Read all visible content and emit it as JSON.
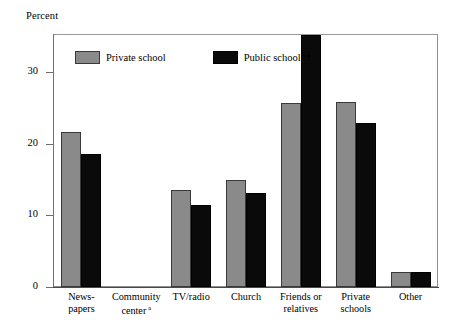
{
  "chart_data": {
    "type": "bar",
    "title": "",
    "subtitle": "",
    "xlabel": "",
    "ylabel": "Percent",
    "ylim": [
      0,
      35.2
    ],
    "yticks": [
      0,
      10,
      20,
      30
    ],
    "ytick_labels": [
      "0",
      "10",
      "20",
      "30"
    ],
    "grid": false,
    "legend_position": "top-left-inside",
    "categories": [
      "News-\npapers",
      "Community\ncenter",
      "TV/radio",
      "Church",
      "Friends or\nrelatives",
      "Private\nschools",
      "Other"
    ],
    "category_footnotes": [
      "",
      "a",
      "",
      "",
      "",
      "",
      ""
    ],
    "series": [
      {
        "name": "Private school",
        "color": "#8a8a8a",
        "values": [
          21.7,
          0,
          13.5,
          14.9,
          25.7,
          25.8,
          2.1
        ]
      },
      {
        "name": "Public school**",
        "color": "#0a0a0a",
        "values": [
          18.6,
          0,
          11.4,
          13.1,
          35.2,
          22.9,
          2.1
        ]
      }
    ],
    "notes": {
      "clipped_bar": "Public school** value for 'Friends or relatives' extends past the top of the plot frame",
      "empty_category": "Community center a has no plotted bars"
    }
  },
  "legend": {
    "items": [
      {
        "label": "Private school",
        "swatch": "private-swatch"
      },
      {
        "label": "Public school**",
        "swatch": "public-swatch"
      }
    ]
  },
  "axis": {
    "y_title": "Percent"
  }
}
